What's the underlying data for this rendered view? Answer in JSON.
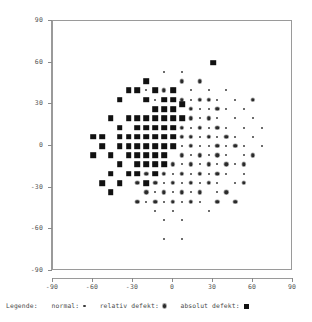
{
  "chart_data": {
    "type": "scatter",
    "title": "",
    "xlabel": "",
    "ylabel": "",
    "xlim": [
      -90,
      90
    ],
    "ylim": [
      -90,
      90
    ],
    "xticks": [
      "-90",
      "-60",
      "-30",
      "0",
      "30",
      "60",
      "90"
    ],
    "yticks": [
      "90",
      "60",
      "30",
      "0",
      "-30",
      "-60",
      "-90"
    ],
    "xtick_values": [
      -90,
      -60,
      -30,
      0,
      30,
      60,
      90
    ],
    "ytick_values": [
      90,
      60,
      30,
      0,
      -30,
      -60,
      -90
    ],
    "grid": false,
    "legend_position": "below-plot",
    "series": [
      {
        "name": "normal",
        "marker": "dot-small",
        "color": "#3c3c3c",
        "points": [
          [
            -6.7,
            53.3
          ],
          [
            6.7,
            53.3
          ],
          [
            -20,
            40
          ],
          [
            13.3,
            40
          ],
          [
            26.7,
            40
          ],
          [
            40,
            40
          ],
          [
            -13.3,
            33.3
          ],
          [
            0,
            33.3
          ],
          [
            13.3,
            33.3
          ],
          [
            33.3,
            33.3
          ],
          [
            46.7,
            33.3
          ],
          [
            20,
            26.7
          ],
          [
            26.7,
            26.7
          ],
          [
            40,
            26.7
          ],
          [
            53.3,
            26.7
          ],
          [
            6.7,
            20
          ],
          [
            20,
            20
          ],
          [
            33.3,
            20
          ],
          [
            46.7,
            20
          ],
          [
            60,
            20
          ],
          [
            13.3,
            13.3
          ],
          [
            26.7,
            13.3
          ],
          [
            40,
            13.3
          ],
          [
            53.3,
            13.3
          ],
          [
            66.7,
            13.3
          ],
          [
            20,
            6.7
          ],
          [
            33.3,
            6.7
          ],
          [
            46.7,
            6.7
          ],
          [
            60,
            6.7
          ],
          [
            6.7,
            0
          ],
          [
            20,
            0
          ],
          [
            26.7,
            0
          ],
          [
            40,
            0
          ],
          [
            53.3,
            0
          ],
          [
            66.7,
            0
          ],
          [
            13.3,
            -6.7
          ],
          [
            26.7,
            -6.7
          ],
          [
            40,
            -6.7
          ],
          [
            53.3,
            -6.7
          ],
          [
            60,
            -6.7
          ],
          [
            6.7,
            -13.3
          ],
          [
            20,
            -13.3
          ],
          [
            33.3,
            -13.3
          ],
          [
            46.7,
            -13.3
          ],
          [
            0,
            -20
          ],
          [
            13.3,
            -20
          ],
          [
            26.7,
            -20
          ],
          [
            40,
            -20
          ],
          [
            53.3,
            -20
          ],
          [
            -6.7,
            -26.7
          ],
          [
            6.7,
            -26.7
          ],
          [
            20,
            -26.7
          ],
          [
            33.3,
            -26.7
          ],
          [
            46.7,
            -26.7
          ],
          [
            -13.3,
            -33.3
          ],
          [
            0,
            -33.3
          ],
          [
            13.3,
            -33.3
          ],
          [
            33.3,
            -33.3
          ],
          [
            -20,
            -40
          ],
          [
            -6.7,
            -40
          ],
          [
            6.7,
            -40
          ],
          [
            20,
            -40
          ],
          [
            -13.3,
            -46.7
          ],
          [
            0,
            -46.7
          ],
          [
            26.7,
            -46.7
          ],
          [
            -6.7,
            -53.3
          ],
          [
            6.7,
            -53.3
          ],
          [
            -6.7,
            -66.7
          ],
          [
            6.7,
            -66.7
          ]
        ]
      },
      {
        "name": "relativ defekt",
        "marker": "circle-dot",
        "color": "#2a2a2a",
        "points": [
          [
            6.7,
            46.7
          ],
          [
            20,
            46.7
          ],
          [
            -6.7,
            40
          ],
          [
            0,
            40
          ],
          [
            6.7,
            33.3
          ],
          [
            20,
            33.3
          ],
          [
            26.7,
            33.3
          ],
          [
            0,
            26.7
          ],
          [
            13.3,
            26.7
          ],
          [
            33.3,
            26.7
          ],
          [
            -6.7,
            20
          ],
          [
            0,
            20
          ],
          [
            13.3,
            20
          ],
          [
            26.7,
            20
          ],
          [
            0,
            13.3
          ],
          [
            6.7,
            13.3
          ],
          [
            20,
            13.3
          ],
          [
            33.3,
            13.3
          ],
          [
            -6.7,
            6.7
          ],
          [
            6.7,
            6.7
          ],
          [
            13.3,
            6.7
          ],
          [
            26.7,
            6.7
          ],
          [
            40,
            6.7
          ],
          [
            -13.3,
            0
          ],
          [
            0,
            0
          ],
          [
            13.3,
            0
          ],
          [
            33.3,
            0
          ],
          [
            46.7,
            0
          ],
          [
            -6.7,
            -6.7
          ],
          [
            6.7,
            -6.7
          ],
          [
            20,
            -6.7
          ],
          [
            33.3,
            -6.7
          ],
          [
            -13.3,
            -13.3
          ],
          [
            0,
            -13.3
          ],
          [
            13.3,
            -13.3
          ],
          [
            26.7,
            -13.3
          ],
          [
            40,
            -13.3
          ],
          [
            -20,
            -20
          ],
          [
            -6.7,
            -20
          ],
          [
            6.7,
            -20
          ],
          [
            20,
            -20
          ],
          [
            33.3,
            -20
          ],
          [
            -26.7,
            -26.7
          ],
          [
            -13.3,
            -26.7
          ],
          [
            0,
            -26.7
          ],
          [
            13.3,
            -26.7
          ],
          [
            26.7,
            -26.7
          ],
          [
            -20,
            -33.3
          ],
          [
            -6.7,
            -33.3
          ],
          [
            6.7,
            -33.3
          ],
          [
            20,
            -33.3
          ],
          [
            40,
            -33.3
          ],
          [
            -26.7,
            -40
          ],
          [
            -13.3,
            -40
          ],
          [
            0,
            -40
          ],
          [
            13.3,
            -40
          ],
          [
            33.3,
            -40
          ],
          [
            60,
            -6.7
          ],
          [
            53.3,
            -13.3
          ],
          [
            60,
            33.3
          ],
          [
            53.3,
            -26.7
          ],
          [
            46.7,
            -40
          ]
        ]
      },
      {
        "name": "absolut defekt",
        "marker": "square-large",
        "color": "#111111",
        "points": [
          [
            30,
            60
          ],
          [
            -20,
            46.7
          ],
          [
            -33.3,
            40
          ],
          [
            -26.7,
            40
          ],
          [
            -13.3,
            40
          ],
          [
            0,
            40
          ],
          [
            -40,
            33.3
          ],
          [
            -20,
            33.3
          ],
          [
            -6.7,
            33.3
          ],
          [
            0,
            33.3
          ],
          [
            6.7,
            30
          ],
          [
            -46.7,
            20
          ],
          [
            -33.3,
            20
          ],
          [
            -26.7,
            20
          ],
          [
            -13.3,
            26.7
          ],
          [
            -6.7,
            26.7
          ],
          [
            0,
            26.7
          ],
          [
            -40,
            13.3
          ],
          [
            -26.7,
            13.3
          ],
          [
            -20,
            20
          ],
          [
            -13.3,
            20
          ],
          [
            -6.7,
            20
          ],
          [
            0,
            20
          ],
          [
            6.7,
            20
          ],
          [
            -53.3,
            6.7
          ],
          [
            -33.3,
            6.7
          ],
          [
            -20,
            13.3
          ],
          [
            -13.3,
            13.3
          ],
          [
            -6.7,
            13.3
          ],
          [
            0,
            13.3
          ],
          [
            -60,
            6.7
          ],
          [
            -40,
            6.7
          ],
          [
            -26.7,
            6.7
          ],
          [
            -20,
            6.7
          ],
          [
            -13.3,
            6.7
          ],
          [
            -6.7,
            6.7
          ],
          [
            0,
            6.7
          ],
          [
            -53.3,
            0
          ],
          [
            -40,
            0
          ],
          [
            -33.3,
            0
          ],
          [
            -26.7,
            0
          ],
          [
            -20,
            0
          ],
          [
            -13.3,
            0
          ],
          [
            -6.7,
            0
          ],
          [
            0,
            0
          ],
          [
            -60,
            -6.7
          ],
          [
            -46.7,
            -6.7
          ],
          [
            -33.3,
            -6.7
          ],
          [
            -26.7,
            -6.7
          ],
          [
            -20,
            -6.7
          ],
          [
            -13.3,
            -6.7
          ],
          [
            -6.7,
            -6.7
          ],
          [
            -40,
            -13.3
          ],
          [
            -26.7,
            -13.3
          ],
          [
            -20,
            -13.3
          ],
          [
            -13.3,
            -13.3
          ],
          [
            -6.7,
            -13.3
          ],
          [
            -46.7,
            -20
          ],
          [
            -33.3,
            -20
          ],
          [
            -26.7,
            -20
          ],
          [
            -13.3,
            -20
          ],
          [
            -53.3,
            -26.7
          ],
          [
            -40,
            -26.7
          ],
          [
            -20,
            -26.7
          ],
          [
            -46.7,
            -33.3
          ]
        ]
      }
    ]
  },
  "legend": {
    "title": "Legende:",
    "items": [
      {
        "label": "normal:",
        "marker": "normal"
      },
      {
        "label": "relativ defekt:",
        "marker": "relativ"
      },
      {
        "label": "absolut defekt:",
        "marker": "absolut"
      }
    ]
  }
}
